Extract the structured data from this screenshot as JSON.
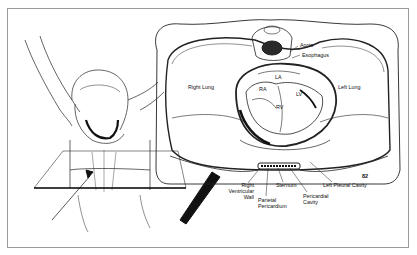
{
  "figure": {
    "number": "82",
    "labels": {
      "aorta": "Aorta",
      "esophagus": "Esophagus",
      "right_lung": "Right Lung",
      "left_lung": "Left Lung",
      "la": "LA",
      "ra": "RA",
      "lv": "LV",
      "rv": "RV",
      "right_ventricular_wall_1": "Right",
      "right_ventricular_wall_2": "Ventricular",
      "right_ventricular_wall_3": "Wall",
      "sternum": "Sternum",
      "parietal_pericardium_1": "Parietal",
      "parietal_pericardium_2": "Pericardium",
      "pericardial_cavity_1": "Pericardial",
      "pericardial_cavity_2": "Cavity",
      "left_pleural_cavity": "Left Pleural Cavity"
    }
  }
}
